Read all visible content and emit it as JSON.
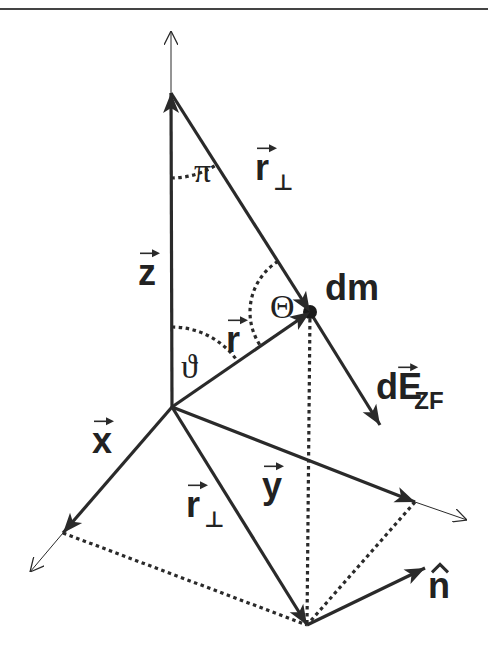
{
  "figure": {
    "width": 488,
    "height": 648,
    "colors": {
      "ink": "#2a2a2a",
      "background": "#ffffff",
      "rule": "#444444"
    }
  },
  "top_rule": {
    "y": 9
  },
  "points": {
    "origin": [
      172,
      407
    ],
    "z_tip": [
      171,
      93
    ],
    "z_axis_end": [
      171,
      31
    ],
    "dm": [
      310,
      312
    ],
    "foot": [
      307,
      625
    ],
    "x_tip": [
      63,
      533
    ],
    "x_axis_end": [
      30,
      572
    ],
    "y_tip": [
      415,
      502
    ],
    "y_axis_end": [
      467,
      520
    ],
    "dE_tip": [
      380,
      425
    ],
    "n_tip": [
      425,
      568
    ]
  },
  "labels": {
    "z": {
      "text": "z",
      "pos": [
        138,
        285
      ],
      "vector": true
    },
    "pi": {
      "text": "π",
      "pos": [
        194,
        182
      ]
    },
    "r_perp_top": {
      "text": "r",
      "sub": "⊥",
      "pos": [
        255,
        180
      ],
      "vector": true
    },
    "theta_upper": {
      "text": "Θ",
      "pos": [
        270,
        318
      ]
    },
    "dm": {
      "text": "dm",
      "pos": [
        325,
        300
      ]
    },
    "r": {
      "text": "r",
      "pos": [
        226,
        352
      ],
      "vector": true
    },
    "vartheta": {
      "text": "ϑ",
      "pos": [
        181,
        378
      ]
    },
    "dE_ZF": {
      "text": "dE",
      "sub": "ZF",
      "pos": [
        376,
        399
      ],
      "vector": true
    },
    "x": {
      "text": "x",
      "pos": [
        92,
        453
      ],
      "vector": true
    },
    "y": {
      "text": "y",
      "pos": [
        262,
        498
      ],
      "vector": true
    },
    "r_perp_bottom": {
      "text": "r",
      "sub": "⊥",
      "pos": [
        186,
        517
      ],
      "vector": true
    },
    "n_hat": {
      "text": "n",
      "pos": [
        428,
        598
      ],
      "hat": true
    }
  }
}
